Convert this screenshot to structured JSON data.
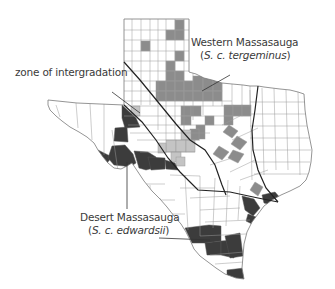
{
  "map": {
    "subject": "Texas county distribution of Massasauga subspecies",
    "colors": {
      "western": "#8c8c8c",
      "intergradation": "#c4c4c4",
      "desert": "#3c3c3c",
      "county_border": "#9a9a9a",
      "state_outline": "#7a7a7a",
      "boundary_line": "#222222",
      "background": "#ffffff"
    },
    "labels": {
      "western": {
        "name": "Western Massasauga",
        "sci_open": "(",
        "sci": "S. c. tergeminus",
        "sci_close": ")"
      },
      "zone": {
        "name": "zone of intergradation"
      },
      "desert": {
        "name": "Desert Massasauga",
        "sci_open": "(",
        "sci": "S. c. edwardsii",
        "sci_close": ")"
      }
    },
    "legend_categories": [
      {
        "key": "western",
        "label": "Western Massasauga (S. c. tergeminus)",
        "shade": "medium gray"
      },
      {
        "key": "intergradation",
        "label": "zone of intergradation",
        "shade": "light gray"
      },
      {
        "key": "desert",
        "label": "Desert Massasauga (S. c. edwardsii)",
        "shade": "dark gray"
      }
    ]
  }
}
